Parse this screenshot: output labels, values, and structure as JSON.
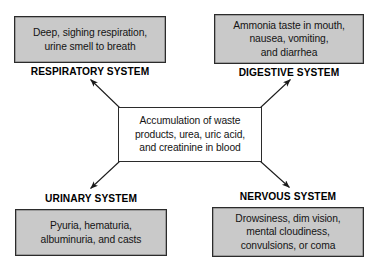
{
  "diagram": {
    "center": {
      "id": "accumulation-of-waste",
      "lines": [
        "Accumulation of waste",
        "products, urea, uric acid,",
        "and creatinine in blood"
      ],
      "text": "Accumulation of waste products, urea, uric acid, and creatinine in blood"
    },
    "systems": [
      {
        "id": "respiratory",
        "label": "RESPIRATORY SYSTEM",
        "position": "top-left",
        "lines": [
          "Deep, sighing respiration,",
          "urine smell to breath"
        ],
        "text": "Deep, sighing respiration, urine smell to breath"
      },
      {
        "id": "digestive",
        "label": "DIGESTIVE SYSTEM",
        "position": "top-right",
        "lines": [
          "Ammonia taste in mouth,",
          "nausea, vomiting,",
          "and diarrhea"
        ],
        "text": "Ammonia taste in mouth, nausea, vomiting, and diarrhea"
      },
      {
        "id": "urinary",
        "label": "URINARY SYSTEM",
        "position": "bottom-left",
        "lines": [
          "Pyuria, hematuria,",
          "albuminuria, and casts"
        ],
        "text": "Pyuria, hematuria, albuminuria, and casts"
      },
      {
        "id": "nervous",
        "label": "NERVOUS SYSTEM",
        "position": "bottom-right",
        "lines": [
          "Drowsiness, dim vision,",
          "mental cloudiness,",
          "convulsions, or coma"
        ],
        "text": "Drowsiness, dim vision, mental cloudiness, convulsions, or coma"
      }
    ],
    "arrows": [
      {
        "id": "arrow-center-to-respiratory",
        "from": "center",
        "to": "respiratory"
      },
      {
        "id": "arrow-center-to-digestive",
        "from": "center",
        "to": "digestive"
      },
      {
        "id": "arrow-center-to-urinary",
        "from": "center",
        "to": "urinary"
      },
      {
        "id": "arrow-center-to-nervous",
        "from": "center",
        "to": "nervous"
      }
    ],
    "colors": {
      "background": "#ffffff",
      "box_fill": "#c9c9c9",
      "box_border": "#2b2b2b",
      "center_fill": "#ffffff",
      "text": "#141414",
      "arrow": "#1a1a1a"
    }
  }
}
